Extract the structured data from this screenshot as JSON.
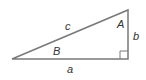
{
  "diagram": {
    "type": "right-triangle",
    "stroke_color": "#7a7a7a",
    "label_color": "#333333",
    "vertices": {
      "left": [
        12,
        59
      ],
      "top_right": [
        128,
        10
      ],
      "right_angle": [
        128,
        59
      ]
    },
    "labels": {
      "hypotenuse": "c",
      "vertical_side": "b",
      "horizontal_side": "a",
      "angle_top": "A",
      "angle_left": "B"
    }
  }
}
